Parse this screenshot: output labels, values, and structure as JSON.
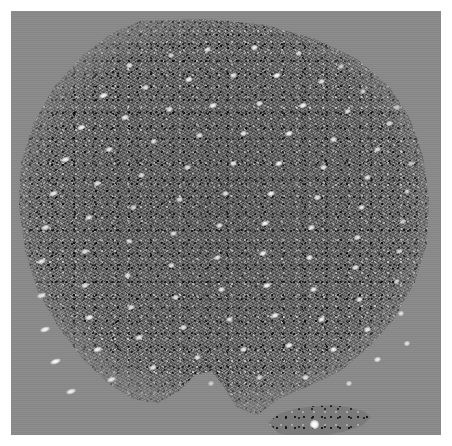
{
  "figure": {
    "kind": "speckle-micrograph",
    "caption": "",
    "width_px": 452,
    "height_px": 446,
    "alt_text": ""
  },
  "colors": {
    "page_background": "#ffffff",
    "field_gray": "#8a8a8a",
    "specimen_gray": "#6f6f6f",
    "spot_white": "#ffffff",
    "speckle_dark": "#000000"
  },
  "plate": {
    "margin_px": 11,
    "inner_width_px": 430,
    "inner_height_px": 424
  },
  "specimen": {
    "label": "specimen region",
    "shape": "irregular rounded polygon with bottom-centre bay",
    "left_px": 6,
    "top_px": 8,
    "width_px": 414,
    "height_px": 400
  },
  "island": {
    "label": "detached speckle island",
    "left_px": 255,
    "top_px": 392,
    "width_px": 105,
    "height_px": 36,
    "bright_spot": {
      "left_px": 299,
      "top_px": 409,
      "size_px": 9
    }
  },
  "spot_lattice": {
    "description": "bright diffraction spots arranged in near-vertical columns",
    "column_spacing_px": 46,
    "row_spacing_px": 23,
    "tilt_deg": -18,
    "spots": [
      {
        "x": 118,
        "y": 54,
        "w": 7,
        "h": 5,
        "a": -18,
        "o": 0.8
      },
      {
        "x": 160,
        "y": 44,
        "w": 6,
        "h": 5,
        "a": -18,
        "o": 0.7
      },
      {
        "x": 196,
        "y": 38,
        "w": 7,
        "h": 5,
        "a": -18,
        "o": 0.85
      },
      {
        "x": 243,
        "y": 36,
        "w": 7,
        "h": 5,
        "a": -18,
        "o": 0.88
      },
      {
        "x": 288,
        "y": 42,
        "w": 6,
        "h": 5,
        "a": -18,
        "o": 0.72
      },
      {
        "x": 330,
        "y": 55,
        "w": 6,
        "h": 5,
        "a": -18,
        "o": 0.66
      },
      {
        "x": 92,
        "y": 84,
        "w": 9,
        "h": 5,
        "a": -18,
        "o": 0.92
      },
      {
        "x": 134,
        "y": 76,
        "w": 7,
        "h": 5,
        "a": -18,
        "o": 0.78
      },
      {
        "x": 178,
        "y": 68,
        "w": 8,
        "h": 5,
        "a": -18,
        "o": 0.9
      },
      {
        "x": 222,
        "y": 64,
        "w": 7,
        "h": 5,
        "a": -18,
        "o": 0.82
      },
      {
        "x": 266,
        "y": 64,
        "w": 8,
        "h": 5,
        "a": -18,
        "o": 0.95
      },
      {
        "x": 310,
        "y": 70,
        "w": 7,
        "h": 5,
        "a": -18,
        "o": 0.8
      },
      {
        "x": 352,
        "y": 80,
        "w": 6,
        "h": 5,
        "a": -18,
        "o": 0.7
      },
      {
        "x": 386,
        "y": 96,
        "w": 6,
        "h": 5,
        "a": -18,
        "o": 0.62
      },
      {
        "x": 70,
        "y": 116,
        "w": 9,
        "h": 5,
        "a": -18,
        "o": 0.9
      },
      {
        "x": 114,
        "y": 106,
        "w": 8,
        "h": 5,
        "a": -18,
        "o": 0.86
      },
      {
        "x": 158,
        "y": 98,
        "w": 7,
        "h": 5,
        "a": -18,
        "o": 0.8
      },
      {
        "x": 202,
        "y": 94,
        "w": 8,
        "h": 5,
        "a": -18,
        "o": 0.88
      },
      {
        "x": 248,
        "y": 92,
        "w": 7,
        "h": 5,
        "a": -18,
        "o": 0.84
      },
      {
        "x": 292,
        "y": 94,
        "w": 8,
        "h": 5,
        "a": -18,
        "o": 0.92
      },
      {
        "x": 336,
        "y": 100,
        "w": 7,
        "h": 5,
        "a": -18,
        "o": 0.78
      },
      {
        "x": 378,
        "y": 112,
        "w": 7,
        "h": 5,
        "a": -18,
        "o": 0.74
      },
      {
        "x": 54,
        "y": 148,
        "w": 9,
        "h": 5,
        "a": -18,
        "o": 0.88
      },
      {
        "x": 98,
        "y": 138,
        "w": 8,
        "h": 5,
        "a": -18,
        "o": 0.82
      },
      {
        "x": 142,
        "y": 130,
        "w": 7,
        "h": 5,
        "a": -18,
        "o": 0.76
      },
      {
        "x": 188,
        "y": 124,
        "w": 7,
        "h": 5,
        "a": -18,
        "o": 0.8
      },
      {
        "x": 232,
        "y": 122,
        "w": 7,
        "h": 5,
        "a": -18,
        "o": 0.84
      },
      {
        "x": 278,
        "y": 122,
        "w": 8,
        "h": 5,
        "a": -18,
        "o": 0.92
      },
      {
        "x": 322,
        "y": 128,
        "w": 7,
        "h": 5,
        "a": -18,
        "o": 0.82
      },
      {
        "x": 366,
        "y": 138,
        "w": 7,
        "h": 5,
        "a": -18,
        "o": 0.76
      },
      {
        "x": 400,
        "y": 152,
        "w": 6,
        "h": 5,
        "a": -18,
        "o": 0.64
      },
      {
        "x": 42,
        "y": 182,
        "w": 9,
        "h": 5,
        "a": -18,
        "o": 0.84
      },
      {
        "x": 86,
        "y": 172,
        "w": 8,
        "h": 5,
        "a": -18,
        "o": 0.8
      },
      {
        "x": 130,
        "y": 164,
        "w": 7,
        "h": 5,
        "a": -18,
        "o": 0.74
      },
      {
        "x": 176,
        "y": 156,
        "w": 7,
        "h": 5,
        "a": -18,
        "o": 0.78
      },
      {
        "x": 222,
        "y": 152,
        "w": 7,
        "h": 5,
        "a": -18,
        "o": 0.82
      },
      {
        "x": 268,
        "y": 152,
        "w": 8,
        "h": 5,
        "a": -18,
        "o": 0.92
      },
      {
        "x": 312,
        "y": 156,
        "w": 7,
        "h": 5,
        "a": -18,
        "o": 0.84
      },
      {
        "x": 356,
        "y": 166,
        "w": 7,
        "h": 5,
        "a": -18,
        "o": 0.78
      },
      {
        "x": 396,
        "y": 180,
        "w": 6,
        "h": 5,
        "a": -18,
        "o": 0.66
      },
      {
        "x": 34,
        "y": 216,
        "w": 9,
        "h": 5,
        "a": -18,
        "o": 0.8
      },
      {
        "x": 78,
        "y": 206,
        "w": 8,
        "h": 5,
        "a": -18,
        "o": 0.76
      },
      {
        "x": 122,
        "y": 196,
        "w": 7,
        "h": 5,
        "a": -18,
        "o": 0.72
      },
      {
        "x": 168,
        "y": 188,
        "w": 7,
        "h": 5,
        "a": -18,
        "o": 0.76
      },
      {
        "x": 214,
        "y": 182,
        "w": 7,
        "h": 5,
        "a": -18,
        "o": 0.8
      },
      {
        "x": 260,
        "y": 182,
        "w": 8,
        "h": 5,
        "a": -18,
        "o": 0.9
      },
      {
        "x": 306,
        "y": 186,
        "w": 7,
        "h": 5,
        "a": -18,
        "o": 0.84
      },
      {
        "x": 350,
        "y": 196,
        "w": 7,
        "h": 5,
        "a": -18,
        "o": 0.78
      },
      {
        "x": 392,
        "y": 210,
        "w": 6,
        "h": 5,
        "a": -18,
        "o": 0.68
      },
      {
        "x": 30,
        "y": 250,
        "w": 9,
        "h": 5,
        "a": -18,
        "o": 0.82
      },
      {
        "x": 74,
        "y": 240,
        "w": 8,
        "h": 5,
        "a": -18,
        "o": 0.78
      },
      {
        "x": 118,
        "y": 230,
        "w": 7,
        "h": 5,
        "a": -18,
        "o": 0.74
      },
      {
        "x": 162,
        "y": 222,
        "w": 7,
        "h": 5,
        "a": -18,
        "o": 0.78
      },
      {
        "x": 208,
        "y": 214,
        "w": 7,
        "h": 5,
        "a": -18,
        "o": 0.82
      },
      {
        "x": 254,
        "y": 212,
        "w": 8,
        "h": 5,
        "a": -18,
        "o": 0.92
      },
      {
        "x": 300,
        "y": 216,
        "w": 7,
        "h": 5,
        "a": -18,
        "o": 0.86
      },
      {
        "x": 346,
        "y": 226,
        "w": 7,
        "h": 5,
        "a": -18,
        "o": 0.8
      },
      {
        "x": 388,
        "y": 240,
        "w": 6,
        "h": 5,
        "a": -18,
        "o": 0.7
      },
      {
        "x": 30,
        "y": 284,
        "w": 9,
        "h": 5,
        "a": -18,
        "o": 0.84
      },
      {
        "x": 74,
        "y": 274,
        "w": 8,
        "h": 5,
        "a": -18,
        "o": 0.8
      },
      {
        "x": 116,
        "y": 264,
        "w": 7,
        "h": 5,
        "a": -18,
        "o": 0.76
      },
      {
        "x": 160,
        "y": 254,
        "w": 7,
        "h": 5,
        "a": -18,
        "o": 0.8
      },
      {
        "x": 206,
        "y": 246,
        "w": 7,
        "h": 5,
        "a": -18,
        "o": 0.84
      },
      {
        "x": 252,
        "y": 242,
        "w": 8,
        "h": 5,
        "a": -18,
        "o": 0.92
      },
      {
        "x": 298,
        "y": 246,
        "w": 7,
        "h": 5,
        "a": -18,
        "o": 0.86
      },
      {
        "x": 344,
        "y": 256,
        "w": 7,
        "h": 5,
        "a": -18,
        "o": 0.82
      },
      {
        "x": 386,
        "y": 270,
        "w": 6,
        "h": 5,
        "a": -18,
        "o": 0.72
      },
      {
        "x": 34,
        "y": 318,
        "w": 10,
        "h": 5,
        "a": -18,
        "o": 0.92
      },
      {
        "x": 78,
        "y": 306,
        "w": 9,
        "h": 5,
        "a": -18,
        "o": 0.88
      },
      {
        "x": 120,
        "y": 296,
        "w": 8,
        "h": 5,
        "a": -18,
        "o": 0.8
      },
      {
        "x": 164,
        "y": 286,
        "w": 7,
        "h": 5,
        "a": -18,
        "o": 0.8
      },
      {
        "x": 210,
        "y": 278,
        "w": 7,
        "h": 5,
        "a": -18,
        "o": 0.84
      },
      {
        "x": 256,
        "y": 274,
        "w": 8,
        "h": 5,
        "a": -18,
        "o": 0.92
      },
      {
        "x": 302,
        "y": 278,
        "w": 7,
        "h": 5,
        "a": -18,
        "o": 0.88
      },
      {
        "x": 348,
        "y": 288,
        "w": 7,
        "h": 5,
        "a": -18,
        "o": 0.84
      },
      {
        "x": 390,
        "y": 302,
        "w": 6,
        "h": 5,
        "a": -18,
        "o": 0.74
      },
      {
        "x": 44,
        "y": 350,
        "w": 11,
        "h": 5,
        "a": -18,
        "o": 0.96
      },
      {
        "x": 86,
        "y": 338,
        "w": 9,
        "h": 5,
        "a": -18,
        "o": 0.9
      },
      {
        "x": 128,
        "y": 326,
        "w": 8,
        "h": 5,
        "a": -18,
        "o": 0.82
      },
      {
        "x": 172,
        "y": 316,
        "w": 7,
        "h": 5,
        "a": -18,
        "o": 0.8
      },
      {
        "x": 218,
        "y": 308,
        "w": 7,
        "h": 5,
        "a": -18,
        "o": 0.84
      },
      {
        "x": 264,
        "y": 304,
        "w": 8,
        "h": 5,
        "a": -18,
        "o": 0.92
      },
      {
        "x": 310,
        "y": 308,
        "w": 7,
        "h": 5,
        "a": -18,
        "o": 0.9
      },
      {
        "x": 356,
        "y": 318,
        "w": 7,
        "h": 5,
        "a": -18,
        "o": 0.86
      },
      {
        "x": 396,
        "y": 332,
        "w": 6,
        "h": 5,
        "a": -18,
        "o": 0.76
      },
      {
        "x": 60,
        "y": 380,
        "w": 10,
        "h": 5,
        "a": -18,
        "o": 0.88
      },
      {
        "x": 100,
        "y": 368,
        "w": 9,
        "h": 5,
        "a": -18,
        "o": 0.84
      },
      {
        "x": 142,
        "y": 356,
        "w": 8,
        "h": 5,
        "a": -18,
        "o": 0.8
      },
      {
        "x": 186,
        "y": 346,
        "w": 7,
        "h": 5,
        "a": -18,
        "o": 0.76
      },
      {
        "x": 232,
        "y": 338,
        "w": 7,
        "h": 5,
        "a": -18,
        "o": 0.82
      },
      {
        "x": 278,
        "y": 334,
        "w": 8,
        "h": 5,
        "a": -18,
        "o": 0.9
      },
      {
        "x": 322,
        "y": 338,
        "w": 7,
        "h": 5,
        "a": -18,
        "o": 0.88
      },
      {
        "x": 366,
        "y": 348,
        "w": 7,
        "h": 5,
        "a": -18,
        "o": 0.84
      },
      {
        "x": 200,
        "y": 372,
        "w": 6,
        "h": 5,
        "a": -18,
        "o": 0.6
      },
      {
        "x": 248,
        "y": 366,
        "w": 7,
        "h": 5,
        "a": -18,
        "o": 0.72
      },
      {
        "x": 294,
        "y": 366,
        "w": 7,
        "h": 5,
        "a": -18,
        "o": 0.78
      },
      {
        "x": 338,
        "y": 372,
        "w": 6,
        "h": 5,
        "a": -18,
        "o": 0.7
      }
    ]
  }
}
